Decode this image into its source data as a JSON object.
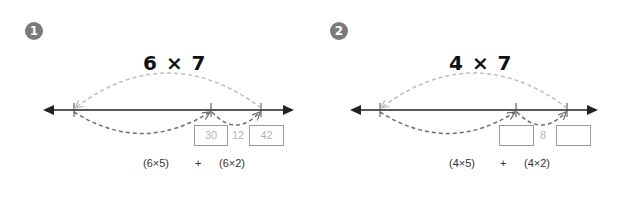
{
  "problems": [
    {
      "number": "1",
      "title": "6 × 7",
      "boxes": [
        "30",
        "42"
      ],
      "difference": "12",
      "expressions": {
        "left": "(6×5)",
        "operator": "+",
        "right": "(6×2)"
      }
    },
    {
      "number": "2",
      "title": "4 × 7",
      "boxes": [
        "",
        ""
      ],
      "difference": "8",
      "expressions": {
        "left": "(4×5)",
        "operator": "+",
        "right": "(4×2)"
      }
    }
  ],
  "colors": {
    "badge": "#7a7a7a",
    "number_line": "#222222",
    "arc_light": "#bdbdbd",
    "arc_dark": "#6e6e6e",
    "box_border": "#9b9b9b",
    "box_text": "#b4b4b4"
  }
}
